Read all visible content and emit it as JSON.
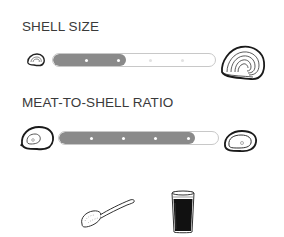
{
  "shell_size": {
    "title": "SHELL SIZE",
    "left_icon": "small-oyster-shell-icon",
    "right_icon": "large-oyster-shell-icon",
    "level": 2,
    "max_level": 5,
    "fill_color": "#8a8a8a"
  },
  "meat_to_shell_ratio": {
    "title": "MEAT-TO-SHELL RATIO",
    "left_icon": "low-meat-shell-icon",
    "right_icon": "high-meat-shell-icon",
    "level": 4,
    "max_level": 5,
    "fill_color": "#8a8a8a"
  },
  "pairings": [
    {
      "icon": "spoon-icon"
    },
    {
      "icon": "stout-glass-icon"
    }
  ]
}
